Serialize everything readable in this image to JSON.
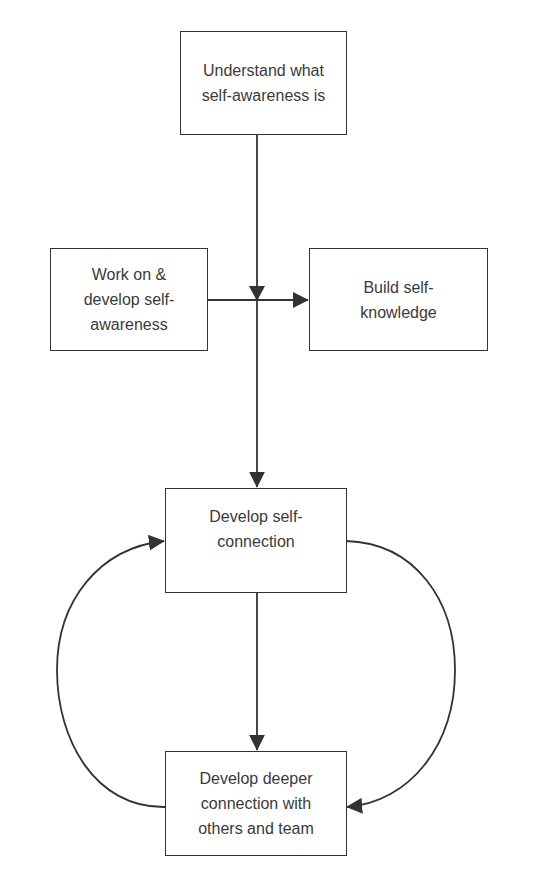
{
  "diagram": {
    "type": "flowchart",
    "colors": {
      "stroke": "#333333",
      "text": "#3a3a3a",
      "background": "#ffffff"
    },
    "nodes": {
      "understand": {
        "lines": [
          "Understand what",
          "self-awareness is"
        ]
      },
      "work_on": {
        "lines": [
          "Work on &",
          "develop self-",
          "awareness"
        ]
      },
      "build": {
        "lines": [
          "Build self-",
          "knowledge"
        ]
      },
      "self_connection": {
        "lines": [
          "Develop self-",
          "connection"
        ]
      },
      "deeper_connection": {
        "lines": [
          "Develop deeper",
          "connection with",
          "others and team"
        ]
      }
    },
    "edges": [
      {
        "from": "understand",
        "to": "self_connection",
        "style": "straight-down"
      },
      {
        "from": "work_on",
        "to": "build",
        "style": "straight-right"
      },
      {
        "from": "self_connection",
        "to": "deeper_connection",
        "style": "straight-down"
      },
      {
        "from": "self_connection",
        "to": "deeper_connection",
        "style": "curved-right"
      },
      {
        "from": "deeper_connection",
        "to": "self_connection",
        "style": "curved-left"
      }
    ]
  }
}
